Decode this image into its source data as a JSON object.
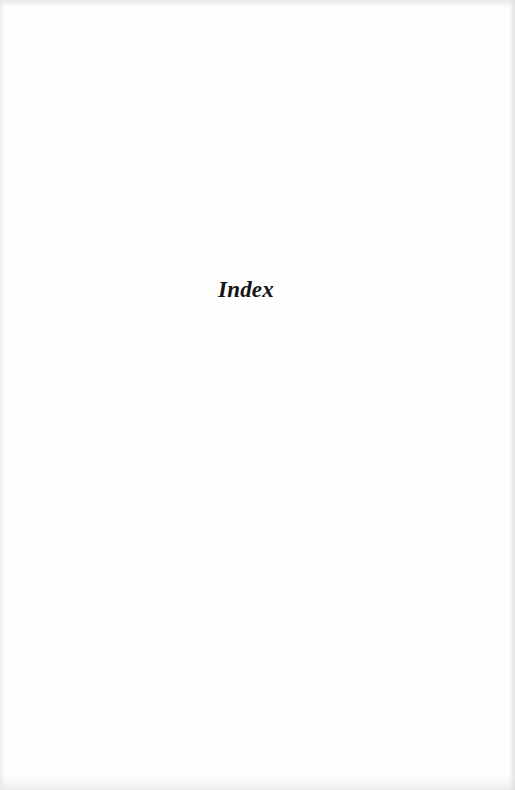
{
  "page": {
    "heading": "Index"
  }
}
